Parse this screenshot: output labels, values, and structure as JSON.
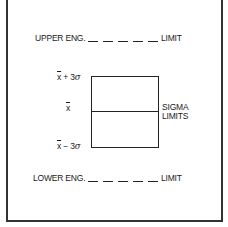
{
  "diagram": {
    "upper_limit": {
      "prefix": "UPPER ENG.",
      "suffix": "LIMIT",
      "dash_count": 5
    },
    "lower_limit": {
      "prefix": "LOWER ENG.",
      "suffix": "LIMIT",
      "dash_count": 5
    },
    "control_box": {
      "labels": {
        "upper": {
          "symbol": "x",
          "operator": "+ 3",
          "sigma": "σ"
        },
        "center": {
          "symbol": "x"
        },
        "lower": {
          "symbol": "x",
          "operator": "− 3",
          "sigma": "σ"
        }
      },
      "side_label_line1": "SIGMA",
      "side_label_line2": "LIMITS"
    },
    "colors": {
      "line": "#222222",
      "frame": "#333333",
      "background": "#ffffff"
    }
  }
}
